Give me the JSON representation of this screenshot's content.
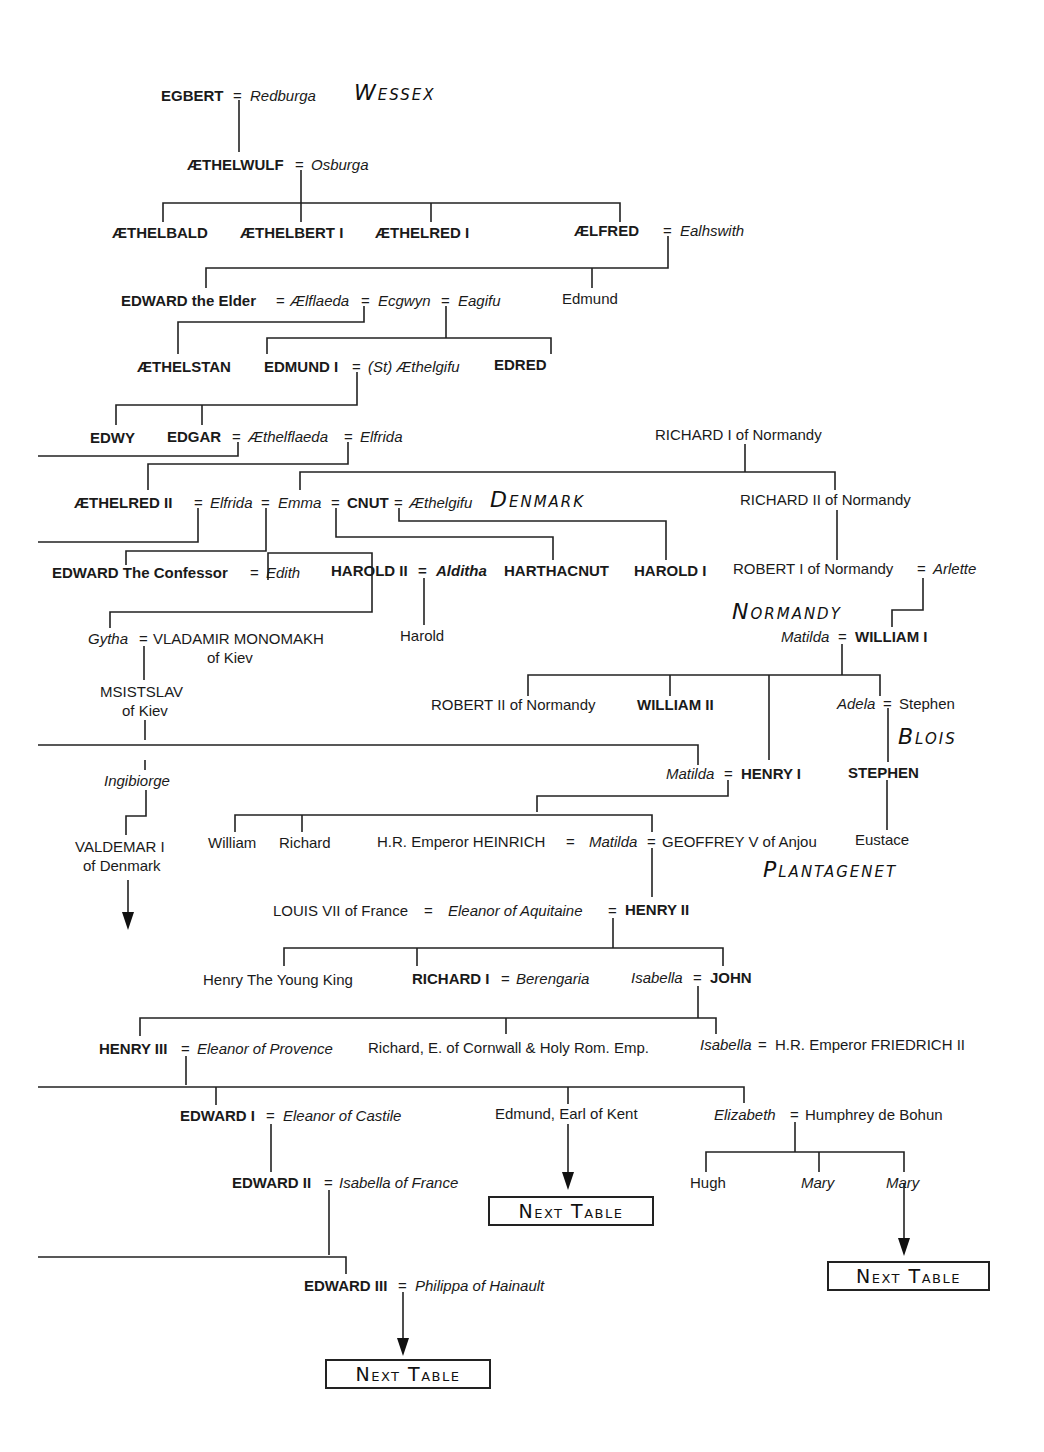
{
  "houses": {
    "wessex": "Wessex",
    "denmark": "Denmark",
    "normandy": "Normandy",
    "blois": "Blois",
    "plantagenet": "Plantagenet"
  },
  "eq": "=",
  "persons": {
    "egbert": "EGBERT",
    "redburga": "Redburga",
    "aethelwulf": "ÆTHELWULF",
    "osburga": "Osburga",
    "aethelbald": "ÆTHELBALD",
    "aethelbert1": "ÆTHELBERT I",
    "aethelred1": "ÆTHELRED I",
    "aelfred": "ÆLFRED",
    "ealhswith": "Ealhswith",
    "edward_elder": "EDWARD the Elder",
    "aelflaeda": "Ælflaeda",
    "ecgwyn": "Ecgwyn",
    "eagifu": "Eagifu",
    "edmund_alfred": "Edmund",
    "aethelstan": "ÆTHELSTAN",
    "edmund1": "EDMUND I",
    "st_aethelgifu": "(St) Æthelgifu",
    "edred": "EDRED",
    "edwy": "EDWY",
    "edgar": "EDGAR",
    "aethelflaeda": "Æthelflaeda",
    "elfrida1": "Elfrida",
    "richard1_norm": "RICHARD I of Normandy",
    "aethelred2": "ÆTHELRED II",
    "elfrida2": "Elfrida",
    "emma": "Emma",
    "cnut": "CNUT",
    "aethelgifu": "Æthelgifu",
    "richard2_norm": "RICHARD II of Normandy",
    "edward_confessor": "EDWARD The Confessor",
    "edith": "Edith",
    "harold2": "HAROLD II",
    "aldith": "Alditha",
    "harthacnut": "HARTHACNUT",
    "harold1": "HAROLD I",
    "robert1_norm": "ROBERT I of Normandy",
    "arlette": "Arlette",
    "gytha": "Gytha",
    "vladamir": "VLADAMIR MONOMAKH",
    "vladamir_of": "of Kiev",
    "harold_son": "Harold",
    "matilda_w1": "Matilda",
    "william1": "WILLIAM I",
    "msistslav": "MSISTSLAV",
    "msistslav_of": "of Kiev",
    "robert2_norm": "ROBERT II of Normandy",
    "william2": "WILLIAM II",
    "adela": "Adela",
    "stephen_blois": "Stephen",
    "ingibiorge": "Ingibiorge",
    "matilda_h1": "Matilda",
    "henry1": "HENRY I",
    "stephen": "STEPHEN",
    "valdemar": "VALDEMAR I",
    "valdemar_of": "of Denmark",
    "william_h1": "William",
    "richard_h1": "Richard",
    "heinrich": "H.R. Emperor HEINRICH",
    "matilda_emp": "Matilda",
    "geoffrey": "GEOFFREY V of Anjou",
    "eustace": "Eustace",
    "louis7": "LOUIS VII of France",
    "eleanor_aq": "Eleanor of Aquitaine",
    "henry2": "HENRY II",
    "young_king": "Henry The Young King",
    "richard1": "RICHARD I",
    "berengaria": "Berengaria",
    "isabella_j": "Isabella",
    "john": "JOHN",
    "henry3": "HENRY III",
    "eleanor_prov": "Eleanor of Provence",
    "richard_cornwall": "Richard, E. of Cornwall & Holy Rom. Emp.",
    "isabella_f": "Isabella",
    "friedrich": "H.R. Emperor FRIEDRICH II",
    "edward1": "EDWARD I",
    "eleanor_cast": "Eleanor of Castile",
    "edmund_kent": "Edmund, Earl of Kent",
    "elizabeth": "Elizabeth",
    "humphrey": "Humphrey de Bohun",
    "edward2": "EDWARD II",
    "isabella_fr": "Isabella of France",
    "hugh": "Hugh",
    "mary1": "Mary",
    "mary2": "Mary",
    "edward3": "EDWARD III",
    "philippa": "Philippa of Hainault"
  },
  "next_table": {
    "label": "Next Table"
  }
}
